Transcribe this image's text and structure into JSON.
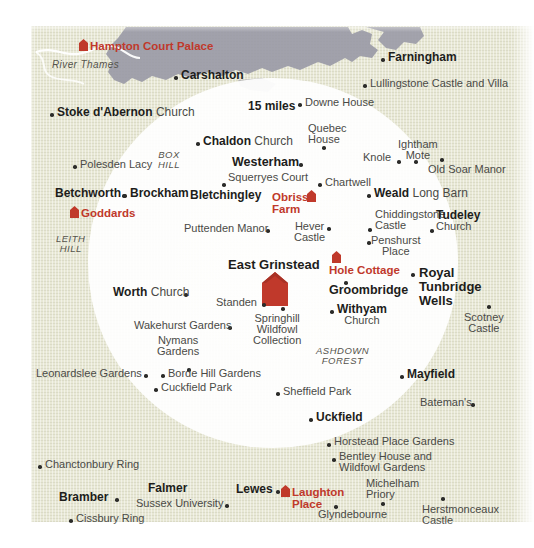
{
  "map": {
    "title": "15-mile radius map around East Grinstead",
    "scale_label": "15 miles",
    "colors": {
      "land": "#e8e8d5",
      "urban": "#9a9aa6",
      "highlight_red": "#c0392b",
      "circle_fill": "#ffffff",
      "text_bold": "#1d1d1b",
      "text_plain": "#4a4a46"
    },
    "water_labels": [
      {
        "name": "river-thames",
        "text": "River Thames",
        "x": 52,
        "y": 62
      }
    ],
    "area_labels": [
      {
        "name": "box-hill",
        "line1": "BOX",
        "line2": "HILL",
        "x": 160,
        "y": 152
      },
      {
        "name": "leith-hill",
        "line1": "LEITH",
        "line2": "HILL",
        "x": 58,
        "y": 236
      },
      {
        "name": "ashdown-forest",
        "line1": "ASHDOWN",
        "line2": "FOREST",
        "x": 320,
        "y": 348
      }
    ],
    "red_markers": [
      {
        "name": "hampton-court-palace",
        "label": "Hampton Court Palace",
        "x": 79,
        "y": 41,
        "size": "small"
      },
      {
        "name": "goddards",
        "label": "Goddards",
        "x": 70,
        "y": 208,
        "size": "small"
      },
      {
        "name": "obriss-farm",
        "label_line1": "Obriss",
        "label_line2": "Farm",
        "x": 307,
        "y": 192,
        "size": "small"
      },
      {
        "name": "hole-cottage",
        "label": "Hole Cottage",
        "x": 332,
        "y": 265,
        "size": "small"
      },
      {
        "name": "laughton-place",
        "label_line1": "Laughton",
        "label_line2": "Place",
        "x": 281,
        "y": 487,
        "size": "small"
      },
      {
        "name": "east-grinstead",
        "label": "East Grinstead",
        "x": 262,
        "y": 258,
        "size": "big"
      }
    ],
    "places": [
      {
        "name": "carshalton",
        "bold": "Carshalton",
        "plain": "",
        "x": 181,
        "y": 73,
        "dot": "left"
      },
      {
        "name": "farningham",
        "bold": "Farningham",
        "plain": "",
        "x": 388,
        "y": 55,
        "dot": "left"
      },
      {
        "name": "lullingstone-castle-and-villa",
        "bold": "",
        "plain": "Lullingstone Castle and Villa",
        "x": 370,
        "y": 81,
        "dot": "left"
      },
      {
        "name": "downe-house",
        "bold": "",
        "plain": "Downe House",
        "x": 305,
        "y": 100,
        "dot": "left"
      },
      {
        "name": "stoke-dabernon-church",
        "bold": "Stoke d'Abernon",
        "plain": "Church",
        "x": 57,
        "y": 110,
        "dot": "left"
      },
      {
        "name": "quebec-house",
        "bold": "",
        "plain_line1": "Quebec",
        "plain_line2": "House",
        "x": 311,
        "y": 126,
        "dot": "below"
      },
      {
        "name": "chaldon-church",
        "bold": "Chaldon",
        "plain": "Church",
        "x": 203,
        "y": 139,
        "dot": "left"
      },
      {
        "name": "knole",
        "bold": "",
        "plain": "Knole",
        "x": 363,
        "y": 155,
        "dot": "right"
      },
      {
        "name": "ightham-mote",
        "bold": "",
        "plain_line1": "Ightham",
        "plain_line2": "Mote",
        "x": 403,
        "y": 142,
        "dot": "below"
      },
      {
        "name": "polesden-lacy",
        "bold": "",
        "plain": "Polesden Lacy",
        "x": 80,
        "y": 162,
        "dot": "left"
      },
      {
        "name": "old-soar-manor",
        "bold": "",
        "plain": "Old Soar Manor",
        "x": 434,
        "y": 167,
        "dot": "above"
      },
      {
        "name": "westerham",
        "bold": "Westerham",
        "plain": "",
        "x": 234,
        "y": 160,
        "dot": "right"
      },
      {
        "name": "squerryes-court",
        "bold": "",
        "plain": "Squerryes Court",
        "x": 228,
        "y": 176,
        "dot": "none"
      },
      {
        "name": "chartwell",
        "bold": "",
        "plain": "Chartwell",
        "x": 325,
        "y": 180,
        "dot": "left"
      },
      {
        "name": "weald-long-barn",
        "bold": "Weald",
        "plain": "Long Barn",
        "x": 374,
        "y": 191,
        "dot": "left"
      },
      {
        "name": "betchworth",
        "bold": "Betchworth",
        "plain": "",
        "x": 55,
        "y": 191,
        "dot": "right"
      },
      {
        "name": "brockham",
        "bold": "Brockham",
        "plain": "",
        "x": 130,
        "y": 191,
        "dot": "left"
      },
      {
        "name": "bletchingley",
        "bold": "Bletchingley",
        "plain": "",
        "x": 219,
        "y": 193,
        "dot": "above"
      },
      {
        "name": "chiddingstone-castle",
        "bold": "",
        "plain_line1": "Chiddingstone",
        "plain_line2": "Castle",
        "x": 375,
        "y": 212,
        "dot": "left2"
      },
      {
        "name": "tudeley-church",
        "bold": "Tudeley",
        "plain": "Church",
        "x": 437,
        "y": 212,
        "dot": "left2"
      },
      {
        "name": "puttenden-manor",
        "bold": "",
        "plain": "Puttenden Manor",
        "x": 184,
        "y": 226,
        "dot": "right"
      },
      {
        "name": "hever-castle",
        "bold": "",
        "plain_line1": "Hever",
        "plain_line2": "Castle",
        "x": 299,
        "y": 224,
        "dot": "right"
      },
      {
        "name": "penshurst-place",
        "bold": "",
        "plain_line1": "Penshurst",
        "plain_line2": "Place",
        "x": 374,
        "y": 238,
        "dot": "left"
      },
      {
        "name": "royal-tunbridge-wells",
        "bold_line1": "Royal",
        "bold_line2": "Tunbridge",
        "bold_line3": "Wells",
        "x": 419,
        "y": 270,
        "dot": "left"
      },
      {
        "name": "standen",
        "bold": "",
        "plain": "Standen",
        "x": 216,
        "y": 300,
        "dot": "right"
      },
      {
        "name": "worth-church",
        "bold": "Worth",
        "plain": "Church",
        "x": 113,
        "y": 290,
        "dot": "right"
      },
      {
        "name": "groombridge",
        "bold": "Groombridge",
        "plain": "",
        "x": 329,
        "y": 288,
        "dot": "above"
      },
      {
        "name": "scotney-castle",
        "bold": "",
        "plain_line1": "Scotney",
        "plain_line2": "Castle",
        "x": 469,
        "y": 308,
        "dot": "above"
      },
      {
        "name": "withyam-church",
        "bold": "Withyam",
        "plain": "Church",
        "x": 337,
        "y": 307,
        "dot": "left"
      },
      {
        "name": "springhill-wildfowl-collection",
        "bold": "",
        "plain_line1": "Springhill",
        "plain_line2": "Wildfowl",
        "plain_line3": "Collection",
        "x": 259,
        "y": 313,
        "dot": "above"
      },
      {
        "name": "wakehurst-gardens",
        "bold": "",
        "plain": "Wakehurst Gardens",
        "x": 134,
        "y": 323,
        "dot": "right"
      },
      {
        "name": "nymans-gardens",
        "bold": "",
        "plain_line1": "Nymans",
        "plain_line2": "Gardens",
        "x": 160,
        "y": 338,
        "dot": "below"
      },
      {
        "name": "leonardslee-gardens",
        "bold": "",
        "plain": "Leonardslee Gardens",
        "x": 36,
        "y": 371,
        "dot": "right"
      },
      {
        "name": "borde-hill-gardens",
        "bold": "",
        "plain": "Borde Hill Gardens",
        "x": 168,
        "y": 371,
        "dot": "left"
      },
      {
        "name": "cuckfield-park",
        "bold": "",
        "plain": "Cuckfield Park",
        "x": 161,
        "y": 385,
        "dot": "left"
      },
      {
        "name": "sheffield-park",
        "bold": "",
        "plain": "Sheffield Park",
        "x": 283,
        "y": 389,
        "dot": "left"
      },
      {
        "name": "mayfield",
        "bold": "Mayfield",
        "plain": "",
        "x": 407,
        "y": 372,
        "dot": "left"
      },
      {
        "name": "batemans",
        "bold": "",
        "plain": "Bateman's",
        "x": 420,
        "y": 400,
        "dot": "right"
      },
      {
        "name": "uckfield",
        "bold": "Uckfield",
        "plain": "",
        "x": 316,
        "y": 415,
        "dot": "left"
      },
      {
        "name": "horstead-place-gardens",
        "bold": "",
        "plain": "Horstead Place Gardens",
        "x": 334,
        "y": 440,
        "dot": "left"
      },
      {
        "name": "bentley-house-and-wildfowl-gardens",
        "bold": "",
        "plain_line1": "Bentley House and",
        "plain_line2": "Wildfowl Gardens",
        "x": 339,
        "y": 455,
        "dot": "left"
      },
      {
        "name": "chanctonbury-ring",
        "bold": "",
        "plain": "Chanctonbury Ring",
        "x": 45,
        "y": 462,
        "dot": "left"
      },
      {
        "name": "michelham-priory",
        "bold": "",
        "plain_line1": "Michelham",
        "plain_line2": "Priory",
        "x": 366,
        "y": 482,
        "dot": "below"
      },
      {
        "name": "herstmonceaux-castle",
        "bold": "",
        "plain_line1": "Herstmonceaux",
        "plain_line2": "Castle",
        "x": 435,
        "y": 504,
        "dot": "above"
      },
      {
        "name": "falmer",
        "bold": "Falmer",
        "plain": "",
        "x": 148,
        "y": 486,
        "dot": "none"
      },
      {
        "name": "sussex-university",
        "bold": "",
        "plain": "Sussex University",
        "x": 136,
        "y": 501,
        "dot": "right"
      },
      {
        "name": "lewes",
        "bold": "Lewes",
        "plain": "",
        "x": 236,
        "y": 487,
        "dot": "right"
      },
      {
        "name": "bramber",
        "bold": "Bramber",
        "plain": "",
        "x": 59,
        "y": 495,
        "dot": "right"
      },
      {
        "name": "cissbury-ring",
        "bold": "",
        "plain": "Cissbury Ring",
        "x": 76,
        "y": 516,
        "dot": "left"
      },
      {
        "name": "glyndebourne",
        "bold": "",
        "plain": "Glyndebourne",
        "x": 318,
        "y": 512,
        "dot": "above"
      }
    ]
  }
}
